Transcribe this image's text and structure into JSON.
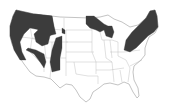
{
  "map": {
    "subject": "United States map with shaded distribution regions",
    "colors": {
      "background": "#ffffff",
      "shaded_region": "#3c3c3c",
      "state_border": "#b4b4b4",
      "outline": "#9a9a9a"
    },
    "shaded_regions": [
      {
        "name": "Pacific Northwest and Northern Rockies",
        "area": "WA, OR, ID, western MT, northern CA"
      },
      {
        "name": "California Coast and Sierra",
        "area": "CA"
      },
      {
        "name": "Great Basin ranges",
        "area": "NV, UT"
      },
      {
        "name": "Southern Rockies",
        "area": "CO, NM"
      },
      {
        "name": "Black Hills",
        "area": "WY/SD"
      },
      {
        "name": "Upper Great Lakes",
        "area": "MN, WI, MI"
      },
      {
        "name": "Northeast and Appalachians",
        "area": "ME, NH, VT, NY, PA, New England"
      }
    ]
  }
}
